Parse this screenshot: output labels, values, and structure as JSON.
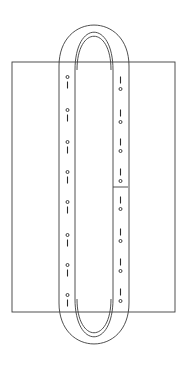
{
  "figure": {
    "title": "Vertical loop band over rectangle",
    "background_color": "#ffffff",
    "line_color": "#3c3c3c",
    "marker_color": "#2a2a2a",
    "width": 186,
    "height": 369
  },
  "rectangle": {
    "name": "base-rectangle",
    "x": 12,
    "y": 62,
    "width": 163,
    "height": 250,
    "label": "Rectangle"
  },
  "loop": {
    "name": "belt-loop",
    "label": "Loop band",
    "outer_left": 59,
    "outer_right": 129,
    "inner_left": 75,
    "inner_right": 113,
    "top": 14,
    "bottom": 355,
    "cap_height": 52,
    "inner_cap_offset": 9
  },
  "left_strip": {
    "name": "left-strip",
    "label": "Left strip",
    "x_left": 60,
    "x_right": 75,
    "marker_order": "circle-above-dash",
    "marker_count": 8,
    "markers": [
      {
        "y": 77,
        "circle_y": 77,
        "dash_y": 85
      },
      {
        "y": 110,
        "circle_y": 110,
        "dash_y": 118
      },
      {
        "y": 142,
        "circle_y": 142,
        "dash_y": 150
      },
      {
        "y": 172,
        "circle_y": 172,
        "dash_y": 180
      },
      {
        "y": 202,
        "circle_y": 202,
        "dash_y": 210
      },
      {
        "y": 235,
        "circle_y": 235,
        "dash_y": 243
      },
      {
        "y": 265,
        "circle_y": 265,
        "dash_y": 273
      },
      {
        "y": 295,
        "circle_y": 295,
        "dash_y": 303
      }
    ]
  },
  "right_strip": {
    "name": "right-strip",
    "label": "Right strip",
    "x_left": 113,
    "x_right": 128,
    "marker_order": "dash-above-circle",
    "marker_count": 8,
    "markers": [
      {
        "y": 80,
        "dash_y": 80,
        "circle_y": 89
      },
      {
        "y": 113,
        "dash_y": 113,
        "circle_y": 122
      },
      {
        "y": 142,
        "dash_y": 142,
        "circle_y": 151
      },
      {
        "y": 172,
        "dash_y": 172,
        "circle_y": 181
      },
      {
        "y": 200,
        "dash_y": 200,
        "circle_y": 209
      },
      {
        "y": 232,
        "dash_y": 232,
        "circle_y": 241
      },
      {
        "y": 262,
        "dash_y": 262,
        "circle_y": 271
      },
      {
        "y": 292,
        "dash_y": 292,
        "circle_y": 301
      }
    ],
    "crossbar": {
      "name": "right-strip-crossbar",
      "y": 187,
      "x_left": 113,
      "x_right": 128,
      "label": "Splice mark"
    }
  },
  "marker_style": {
    "dash_length": 7,
    "circle_radius": 1.5
  }
}
